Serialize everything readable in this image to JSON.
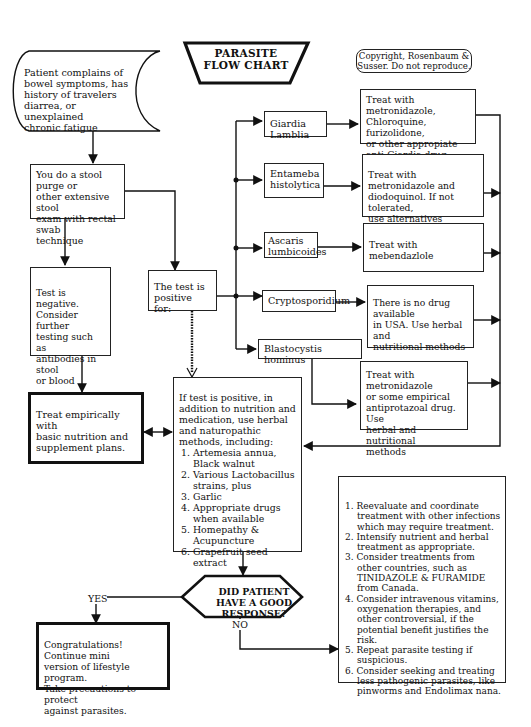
{
  "title": {
    "line1": "PARASITE",
    "line2": "FLOW CHART"
  },
  "copyright": "Copyright, Rosenbaum &\nSusser. Do not reproduce.",
  "start": "Patient complains of\nbowel symptoms, has\nhistory of travelers\ndiarrea, or unexplained\nchronic fatigue",
  "stool_exam": "You do a stool purge or\nother extensive stool\nexam with rectal swab\ntechnique",
  "test_negative": "Test is negative.\nConsider further\ntesting such as\nantibodies in stool\nor blood",
  "test_positive": "The test is\npositive for:",
  "treat_empirically": "Treat empirically with\nbasic nutrition and\nsupplement plans.",
  "parasites": [
    {
      "name": "Giardia  Lamblia",
      "treatment": "Treat with metronidazole,\nChloroquine, furizolidone,\nor other appropiate\nanti-Giardia drug."
    },
    {
      "name": "Entameba\nhistolytica",
      "treatment": "Treat with metronidazole and\ndiodoquinol.  If not tolerated,\nuse alternatives"
    },
    {
      "name": "Ascaris\nlumbicoides",
      "treatment": "Treat with mebendazlole"
    },
    {
      "name": "Cryptosporidium",
      "treatment": "There is no drug available\nin USA. Use herbal and\nnutritional methods"
    },
    {
      "name": "Blastocystis hominus",
      "treatment": "Treat with metronidazole\nor some empirical\nantiprotazoal drug. Use\nherbal and nutritional\nmethods"
    }
  ],
  "positive_plan": {
    "intro": "If test is positive, in addition to nutrition and medication, use herbal and naturopathic methods, including:",
    "items": [
      "1. Artemesia annua, Black walnut",
      "2. Various Lactobacillus strains, plus",
      "3. Garlic",
      "4. Appropriate drugs when available",
      "5. Homepathy & Acupuncture",
      "6. Grapefruit seed extract"
    ]
  },
  "decision": "DID PATIENT\nHAVE A GOOD\nRESPONSE?",
  "yes_label": "YES",
  "no_label": "NO",
  "yes_outcome": "Congratulations! Continue mini\nversion of lifestyle program.\nTake precautions to protect\nagainst  parasites.",
  "no_outcome": {
    "items": [
      "1. Reevaluate and coordinate treatment with other infections which may require treatment.",
      "2. Intensify nutrient and herbal treatment as appropriate.",
      "3. Consider treatments from other countries, such as TINIDAZOLE & FURAMIDE from Canada.",
      "4. Consider intravenous vitamins, oxygenation therapies, and other controversial, if the potential benefit justifies the  risk.",
      "5. Repeat parasite testing if suspicious.",
      "6. Consider seeking and treating less pathogenic parasites, like pinworms and Endolimax nana."
    ]
  }
}
